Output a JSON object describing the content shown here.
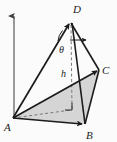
{
  "figure": {
    "kind": "geometry-diagram",
    "canvas": {
      "width": 117,
      "height": 142
    },
    "colors": {
      "stroke": "#1b1b1b",
      "base_fill": "#d5d5d5",
      "background": "#fbfbfb",
      "axis": "#4a4a4a",
      "dashed": "#6e6e6e"
    },
    "vertices": [
      {
        "id": "A",
        "label": "A",
        "x": 13,
        "y": 118,
        "label_x": 6,
        "label_y": 130
      },
      {
        "id": "B",
        "label": "B",
        "x": 84,
        "y": 124,
        "label_x": 87,
        "label_y": 138
      },
      {
        "id": "C",
        "label": "C",
        "x": 99,
        "y": 70,
        "label_x": 103,
        "label_y": 74
      },
      {
        "id": "D",
        "label": "D",
        "x": 71,
        "y": 22,
        "label_x": 74,
        "label_y": 12
      }
    ],
    "height_segment": {
      "label": "h",
      "label_x": 64,
      "label_y": 76,
      "from_x": 71,
      "from_y": 22,
      "to_x": 72,
      "to_y": 110,
      "style": "dashed"
    },
    "angle_marker": {
      "label": "θ",
      "label_x": 62,
      "label_y": 51,
      "arc_center_x": 71,
      "arc_center_y": 22,
      "vertex": "D"
    },
    "right_angle_marker": {
      "x": 68,
      "y": 103,
      "size": 8,
      "at_vertex": "foot-of-altitude"
    },
    "reference_arrow": {
      "name": "vertical-axis-arrow",
      "from_x": 14,
      "from_y": 118,
      "to_x": 14,
      "to_y": 13
    },
    "horizontal_ray": {
      "name": "horizontal-reference-ray-at-D",
      "from_x": 71,
      "from_y": 40,
      "to_x": 87,
      "to_y": 40
    },
    "dashed_base_edge": {
      "name": "dashed-edge-A-to-altitude-foot",
      "from_x": 13,
      "from_y": 118,
      "to_x": 72,
      "to_y": 110
    },
    "edges": [
      {
        "name": "edge-A-D",
        "from": "A",
        "to": "D"
      },
      {
        "name": "edge-A-C",
        "from": "A",
        "to": "C"
      },
      {
        "name": "edge-A-B",
        "from": "A",
        "to": "B"
      },
      {
        "name": "edge-D-C",
        "from": "D",
        "to": "C"
      },
      {
        "name": "edge-D-B",
        "from": "D",
        "to": "B"
      },
      {
        "name": "edge-C-B",
        "from": "C",
        "to": "B"
      }
    ]
  }
}
